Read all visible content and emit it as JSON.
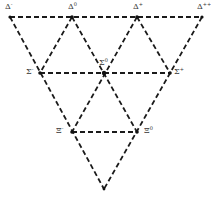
{
  "diagram": {
    "type": "baryon-decuplet-weight-diagram",
    "nodes": [
      {
        "id": "delta_minus",
        "symbol": "Δ",
        "charge": "-",
        "x": 10,
        "y": 17
      },
      {
        "id": "delta_zero",
        "symbol": "Δ",
        "charge": "0",
        "x": 72,
        "y": 17
      },
      {
        "id": "delta_plus",
        "symbol": "Δ",
        "charge": "+",
        "x": 137,
        "y": 17
      },
      {
        "id": "delta_plusplus",
        "symbol": "Δ",
        "charge": "++",
        "x": 202,
        "y": 17
      },
      {
        "id": "sigma_minus",
        "symbol": "Σ",
        "charge": "-",
        "x": 40,
        "y": 73
      },
      {
        "id": "sigma_zero",
        "symbol": "Σ",
        "charge": "0",
        "x": 104,
        "y": 73
      },
      {
        "id": "sigma_plus",
        "symbol": "Σ",
        "charge": "+",
        "x": 170,
        "y": 73
      },
      {
        "id": "xi_minus",
        "symbol": "Ξ",
        "charge": "-",
        "x": 72,
        "y": 132
      },
      {
        "id": "xi_zero",
        "symbol": "Ξ",
        "charge": "0",
        "x": 137,
        "y": 132
      },
      {
        "id": "omega_minus",
        "symbol": "",
        "charge": "",
        "x": 104,
        "y": 189
      }
    ],
    "labels": {
      "delta_minus": {
        "symbol": "Δ",
        "sup": "-"
      },
      "delta_zero": {
        "symbol": "Δ",
        "sup": "0"
      },
      "delta_plus": {
        "symbol": "Δ",
        "sup": "+"
      },
      "delta_plusplus": {
        "symbol": "Δ",
        "sup": "++"
      },
      "sigma_minus": {
        "symbol": "Σ",
        "sup": "-"
      },
      "sigma_zero": {
        "symbol": "Σ",
        "sup": "0"
      },
      "sigma_plus": {
        "symbol": "Σ",
        "sup": "+"
      },
      "xi_minus": {
        "symbol": "Ξ",
        "sup": "-"
      },
      "xi_zero": {
        "symbol": "Ξ",
        "sup": "0"
      }
    },
    "line_style": "dashed",
    "line_color": "#1a1a1a"
  }
}
